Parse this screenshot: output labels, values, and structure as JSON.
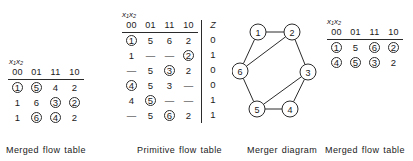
{
  "figure": {
    "kind": "asynchronous-sequential-circuit-state-reduction",
    "panels": [
      "merged-flow-table",
      "primitive-flow-table",
      "merger-diagram",
      "merged-flow-table"
    ]
  },
  "merged_table_left": {
    "caption": "Merged flow table",
    "input_var_label": "x₁x₂",
    "columns": [
      "00",
      "01",
      "11",
      "10"
    ],
    "rows": [
      [
        {
          "v": "1",
          "circled": true
        },
        {
          "v": "5",
          "circled": true
        },
        {
          "v": "4",
          "circled": false
        },
        {
          "v": "2",
          "circled": false
        }
      ],
      [
        {
          "v": "1",
          "circled": false
        },
        {
          "v": "6",
          "circled": false
        },
        {
          "v": "3",
          "circled": true
        },
        {
          "v": "2",
          "circled": true
        }
      ],
      [
        {
          "v": "1",
          "circled": false
        },
        {
          "v": "6",
          "circled": true
        },
        {
          "v": "4",
          "circled": true
        },
        {
          "v": "2",
          "circled": false
        }
      ]
    ]
  },
  "primitive_table": {
    "caption": "Primitive flow table",
    "input_var_label": "x₁x₂",
    "columns": [
      "00",
      "01",
      "11",
      "10"
    ],
    "output_column_label": "Z",
    "rows": [
      {
        "cells": [
          {
            "v": "1",
            "circled": true
          },
          {
            "v": "5",
            "circled": false
          },
          {
            "v": "6",
            "circled": false
          },
          {
            "v": "2",
            "circled": false
          }
        ],
        "z": "0"
      },
      {
        "cells": [
          {
            "v": "1",
            "circled": false
          },
          {
            "v": "—",
            "circled": false
          },
          {
            "v": "—",
            "circled": false
          },
          {
            "v": "2",
            "circled": true
          }
        ],
        "z": "1"
      },
      {
        "cells": [
          {
            "v": "—",
            "circled": false
          },
          {
            "v": "5",
            "circled": false
          },
          {
            "v": "3",
            "circled": true
          },
          {
            "v": "2",
            "circled": false
          }
        ],
        "z": "0"
      },
      {
        "cells": [
          {
            "v": "4",
            "circled": true
          },
          {
            "v": "5",
            "circled": false
          },
          {
            "v": "3",
            "circled": false
          },
          {
            "v": "—",
            "circled": false
          }
        ],
        "z": "0"
      },
      {
        "cells": [
          {
            "v": "4",
            "circled": false
          },
          {
            "v": "5",
            "circled": true
          },
          {
            "v": "—",
            "circled": false
          },
          {
            "v": "—",
            "circled": false
          }
        ],
        "z": "1"
      },
      {
        "cells": [
          {
            "v": "—",
            "circled": false
          },
          {
            "v": "5",
            "circled": false
          },
          {
            "v": "6",
            "circled": true
          },
          {
            "v": "2",
            "circled": false
          }
        ],
        "z": "1"
      }
    ]
  },
  "merger_diagram": {
    "caption": "Merger diagram",
    "nodes": [
      {
        "id": "1",
        "cx": 26,
        "cy": 14
      },
      {
        "id": "2",
        "cx": 60,
        "cy": 14
      },
      {
        "id": "3",
        "cx": 76,
        "cy": 54
      },
      {
        "id": "4",
        "cx": 58,
        "cy": 91
      },
      {
        "id": "5",
        "cx": 25,
        "cy": 91
      },
      {
        "id": "6",
        "cx": 8,
        "cy": 53
      }
    ],
    "edges": [
      [
        "1",
        "2"
      ],
      [
        "1",
        "6"
      ],
      [
        "2",
        "3"
      ],
      [
        "2",
        "6"
      ],
      [
        "3",
        "4"
      ],
      [
        "3",
        "5"
      ],
      [
        "4",
        "5"
      ],
      [
        "5",
        "6"
      ]
    ]
  },
  "merged_table_right": {
    "caption": "Merged flow table",
    "input_var_label": "x₁x₂",
    "columns": [
      "00",
      "01",
      "11",
      "10"
    ],
    "rows": [
      [
        {
          "v": "1",
          "circled": true
        },
        {
          "v": "5",
          "circled": false
        },
        {
          "v": "6",
          "circled": true
        },
        {
          "v": "2",
          "circled": true
        }
      ],
      [
        {
          "v": "4",
          "circled": true
        },
        {
          "v": "5",
          "circled": true
        },
        {
          "v": "3",
          "circled": true
        },
        {
          "v": "2",
          "circled": false
        }
      ]
    ]
  }
}
